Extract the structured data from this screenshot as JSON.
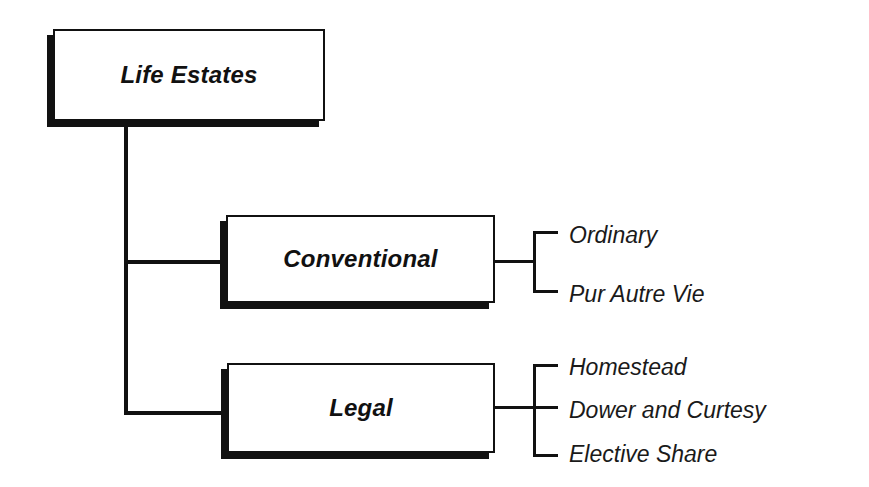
{
  "diagram": {
    "root": {
      "label": "Life Estates"
    },
    "branches": [
      {
        "label": "Conventional",
        "children": [
          "Ordinary",
          "Pur Autre Vie"
        ]
      },
      {
        "label": "Legal",
        "children": [
          "Homestead",
          "Dower and Curtesy",
          "Elective Share"
        ]
      }
    ]
  },
  "colors": {
    "line": "#111111",
    "background": "#ffffff"
  }
}
